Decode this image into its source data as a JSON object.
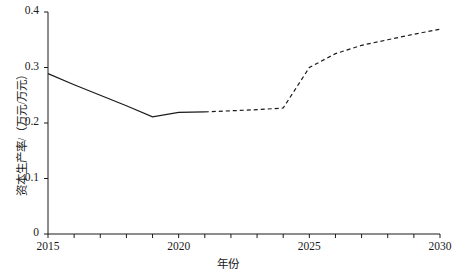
{
  "chart_data": {
    "type": "line",
    "title": "",
    "subtitle": "",
    "xlabel": "年份",
    "ylabel": "资本生产率/（万元/万元）",
    "xlim": [
      2015,
      2030
    ],
    "ylim": [
      0,
      0.4
    ],
    "grid": false,
    "legend": null,
    "legend_position": "none",
    "x_tick_labels": [
      "2015",
      "2020",
      "2025",
      "2030"
    ],
    "x_tick_values": [
      2015,
      2020,
      2025,
      2030
    ],
    "x_minor_ticks": [
      2016,
      2017,
      2018,
      2019,
      2021,
      2022,
      2023,
      2024,
      2026,
      2027,
      2028,
      2029
    ],
    "y_tick_labels": [
      "0",
      "0.1",
      "0.2",
      "0.3",
      "0.4"
    ],
    "y_tick_values": [
      0,
      0.1,
      0.2,
      0.3,
      0.4
    ],
    "series": [
      {
        "name": "历史值",
        "style": "solid",
        "color": "#1a1a1a",
        "x": [
          2015,
          2016,
          2017,
          2018,
          2019,
          2020,
          2021
        ],
        "values": [
          0.289,
          0.269,
          0.25,
          0.231,
          0.211,
          0.219,
          0.22
        ]
      },
      {
        "name": "预测值",
        "style": "dashed",
        "color": "#1a1a1a",
        "x": [
          2021,
          2022,
          2023,
          2024,
          2025,
          2026,
          2027,
          2028,
          2029,
          2030
        ],
        "values": [
          0.22,
          0.222,
          0.224,
          0.227,
          0.3,
          0.325,
          0.34,
          0.35,
          0.36,
          0.369
        ]
      }
    ]
  },
  "axis": {
    "x_title": "年份",
    "y_title": "资本生产率/（万元/万元）"
  }
}
